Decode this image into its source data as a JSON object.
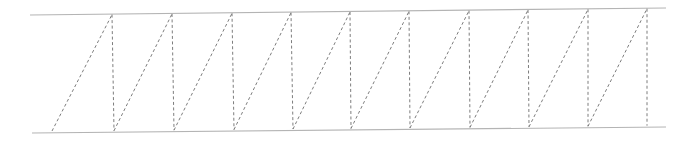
{
  "diagram": {
    "type": "truss",
    "style": {
      "chord_color": "#b4b4b4",
      "web_color": "#6e6e6e",
      "web_dash": "dashed"
    },
    "top_chord": {
      "x1": 30,
      "y1": 15,
      "x2": 666,
      "y2": 8
    },
    "bottom_chord": {
      "x1": 32,
      "y1": 133,
      "x2": 666,
      "y2": 127
    },
    "first_diagonal_start": {
      "x": 52,
      "y": 131
    },
    "top_nodes_x": [
      112,
      172,
      232,
      291,
      350,
      409,
      469,
      528,
      588,
      647
    ],
    "bottom_nodes_x": [
      114,
      174,
      234,
      293,
      351,
      410,
      470,
      529,
      588,
      647
    ],
    "panel_count": 10
  }
}
